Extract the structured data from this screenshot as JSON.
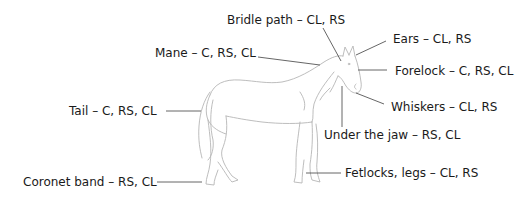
{
  "diagram": {
    "line_color": "#555555",
    "outline_color": "#b0b0b0",
    "text_color": "#1a1a1a",
    "labels": [
      {
        "id": "bridle-path",
        "text": "Bridle path – CL, RS"
      },
      {
        "id": "ears",
        "text": "Ears – CL, RS"
      },
      {
        "id": "mane",
        "text": "Mane – C, RS, CL"
      },
      {
        "id": "forelock",
        "text": "Forelock – C, RS, CL"
      },
      {
        "id": "whiskers",
        "text": "Whiskers – CL, RS"
      },
      {
        "id": "tail",
        "text": "Tail – C, RS, CL"
      },
      {
        "id": "under-the-jaw",
        "text": "Under the jaw – RS, CL"
      },
      {
        "id": "coronet-band",
        "text": "Coronet band – RS, CL"
      },
      {
        "id": "fetlocks-legs",
        "text": "Fetlocks, legs – CL, RS"
      }
    ]
  }
}
